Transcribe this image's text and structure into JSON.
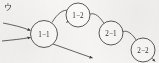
{
  "diagram": {
    "corner_mark": "ウ",
    "nodes": [
      {
        "id": "n11",
        "label": "1−1",
        "cx": 44,
        "cy": 34,
        "r": 13.5
      },
      {
        "id": "n12",
        "label": "1−2",
        "cx": 78,
        "cy": 15,
        "r": 12.0
      },
      {
        "id": "n21",
        "label": "2−1",
        "cx": 111,
        "cy": 33,
        "r": 12.0
      },
      {
        "id": "n22",
        "label": "2−2",
        "cx": 143,
        "cy": 50,
        "r": 12.0
      }
    ],
    "edges": [
      {
        "id": "e_in_upper",
        "from": "external",
        "to": "n11",
        "kind": "incoming-straight"
      },
      {
        "id": "e_in_lower",
        "from": "external",
        "to": "n11",
        "kind": "incoming-straight"
      },
      {
        "id": "e_11_12",
        "from": "n11",
        "to": "n12",
        "kind": "curved-up"
      },
      {
        "id": "e_21_12",
        "from": "n21",
        "to": "n12",
        "kind": "curved-up"
      },
      {
        "id": "e_22_21",
        "from": "n22",
        "to": "n21",
        "kind": "curved-up"
      },
      {
        "id": "e_11_out",
        "from": "n11",
        "to": "external",
        "kind": "outgoing-diagonal"
      },
      {
        "id": "e_22_out",
        "from": "n22",
        "to": "external",
        "kind": "outgoing-stub"
      }
    ],
    "stroke_color": "#4a4845",
    "node_fill": "#fbfaf8",
    "background": "#f7f6f4"
  }
}
